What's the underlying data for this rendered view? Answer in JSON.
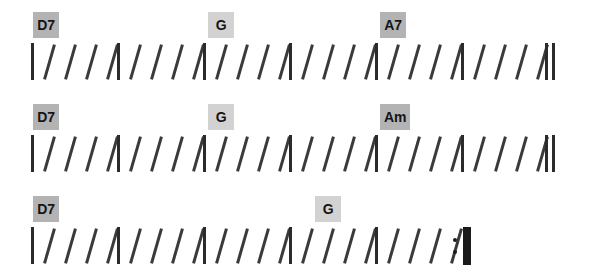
{
  "document": {
    "type": "chord-chart",
    "title": "Chord slash notation chart",
    "background_color": "#ffffff",
    "stroke_color": "#3a3a3a",
    "barline_color": "#2b2b2b",
    "beats_per_measure": 4,
    "beat_symbol": "/"
  },
  "systems": [
    {
      "index": 1,
      "top": 0,
      "measures": [
        {
          "x": 31,
          "chord": "D7",
          "chord_x": 33,
          "chord_box_color": "#b3b3b3",
          "beats": 4
        },
        {
          "x": 117,
          "chord": null,
          "beats": 4
        },
        {
          "x": 203,
          "chord": "G",
          "chord_x": 208,
          "chord_box_color": "#d2d2d2",
          "beats": 4
        },
        {
          "x": 289,
          "chord": null,
          "beats": 4
        },
        {
          "x": 375,
          "chord": "A7",
          "chord_x": 380,
          "chord_box_color": "#b3b3b3",
          "beats": 4
        },
        {
          "x": 461,
          "chord": null,
          "beats": 4
        }
      ],
      "ending": {
        "type": "double-barline",
        "x": 545
      }
    },
    {
      "index": 2,
      "top": 92,
      "measures": [
        {
          "x": 31,
          "chord": "D7",
          "chord_x": 33,
          "chord_box_color": "#b3b3b3",
          "beats": 4
        },
        {
          "x": 117,
          "chord": null,
          "beats": 4
        },
        {
          "x": 203,
          "chord": "G",
          "chord_x": 208,
          "chord_box_color": "#d2d2d2",
          "beats": 4
        },
        {
          "x": 289,
          "chord": null,
          "beats": 4
        },
        {
          "x": 375,
          "chord": "Am",
          "chord_x": 380,
          "chord_box_color": "#b3b3b3",
          "beats": 4
        },
        {
          "x": 461,
          "chord": null,
          "beats": 4
        }
      ],
      "ending": {
        "type": "double-barline",
        "x": 545
      }
    },
    {
      "index": 3,
      "top": 184,
      "measures": [
        {
          "x": 31,
          "chord": "D7",
          "chord_x": 33,
          "chord_box_color": "#b3b3b3",
          "beats": 4
        },
        {
          "x": 117,
          "chord": null,
          "beats": 4
        },
        {
          "x": 203,
          "chord": null,
          "beats": 4
        },
        {
          "x": 289,
          "chord": "G",
          "chord_x": 315,
          "chord_box_color": "#d2d2d2",
          "beats": 4
        },
        {
          "x": 375,
          "chord": null,
          "beats": 4
        }
      ],
      "ending": {
        "type": "repeat-end",
        "x": 452
      }
    }
  ]
}
